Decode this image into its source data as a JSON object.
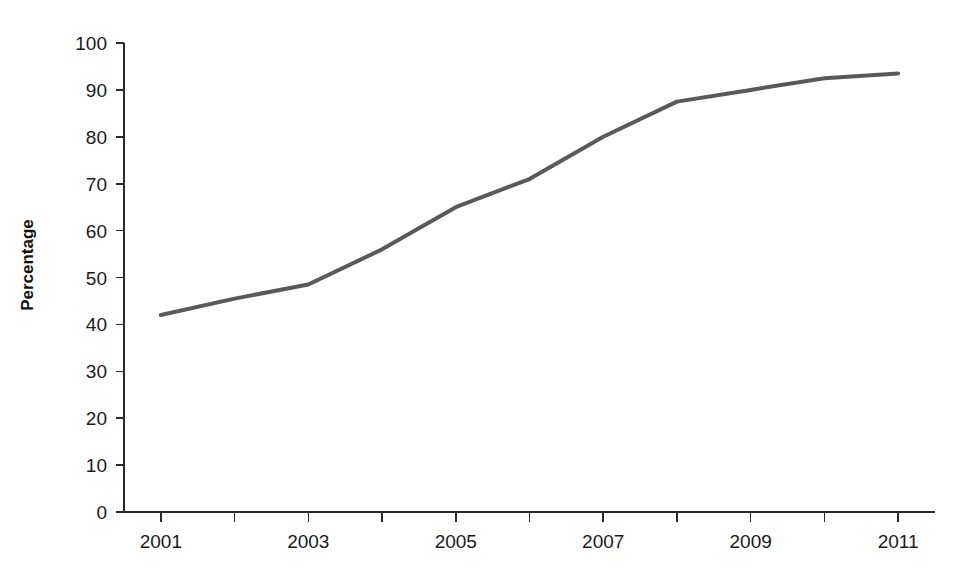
{
  "chart_data": {
    "type": "line",
    "title": "",
    "xlabel": "",
    "ylabel": "Percentage",
    "x": [
      2001,
      2002,
      2003,
      2004,
      2005,
      2006,
      2007,
      2008,
      2009,
      2010,
      2011
    ],
    "values": [
      42,
      45.5,
      48.5,
      56,
      65,
      71,
      80,
      87.5,
      90,
      92.5,
      93.5
    ],
    "series": [
      {
        "name": "Percentage",
        "values": [
          42,
          45.5,
          48.5,
          56,
          65,
          71,
          80,
          87.5,
          90,
          92.5,
          93.5
        ],
        "color": "#595959"
      }
    ],
    "xlim": [
      2000.5,
      2011.5
    ],
    "ylim": [
      0,
      100
    ],
    "y_ticks": [
      0,
      10,
      20,
      30,
      40,
      50,
      60,
      70,
      80,
      90,
      100
    ],
    "y_tick_labels": [
      "0",
      "10",
      "20",
      "30",
      "40",
      "50",
      "60",
      "70",
      "80",
      "90",
      "100"
    ],
    "x_ticks": [
      2001,
      2002,
      2003,
      2004,
      2005,
      2006,
      2007,
      2008,
      2009,
      2010,
      2011
    ],
    "x_tick_labels": [
      "2001",
      "",
      "2003",
      "",
      "2005",
      "",
      "2007",
      "",
      "2009",
      "",
      "2011"
    ],
    "grid": false,
    "legend": false,
    "legend_position": "none",
    "line_color": "#595959",
    "line_width": 4,
    "axis_color": "#2b2b2b",
    "background": "#ffffff",
    "markers": false
  }
}
